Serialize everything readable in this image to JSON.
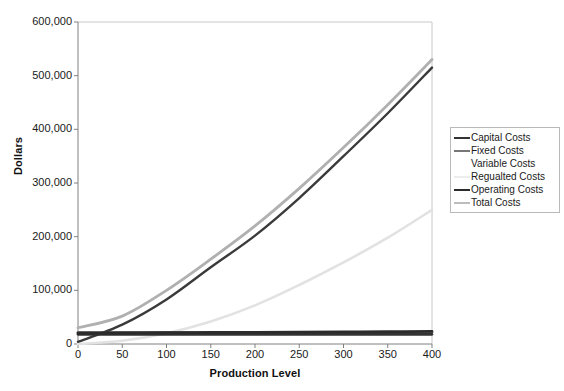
{
  "chart_data": {
    "type": "line",
    "title": "",
    "xlabel": "Production Level",
    "ylabel": "Dollars",
    "xlim": [
      0,
      400
    ],
    "ylim": [
      0,
      600000
    ],
    "x_ticks": [
      "0",
      "50",
      "100",
      "150",
      "200",
      "250",
      "300",
      "350",
      "400"
    ],
    "y_ticks": [
      "0",
      "100,000",
      "200,000",
      "300,000",
      "400,000",
      "500,000",
      "600,000"
    ],
    "x_tick_values": [
      0,
      50,
      100,
      150,
      200,
      250,
      300,
      350,
      400
    ],
    "y_tick_values": [
      0,
      100000,
      200000,
      300000,
      400000,
      500000,
      600000
    ],
    "grid": false,
    "legend_position": "right",
    "x": [
      0,
      50,
      100,
      150,
      200,
      250,
      300,
      350,
      400
    ],
    "series": [
      {
        "name": "Capital Costs",
        "color": "#333333",
        "width": 2.6,
        "values": [
          18000,
          18000,
          18000,
          18000,
          18000,
          18000,
          18000,
          18000,
          18000
        ]
      },
      {
        "name": "Fixed Costs",
        "color": "#777777",
        "width": 2.6,
        "values": [
          22000,
          22000,
          22000,
          22000,
          22000,
          22000,
          22000,
          22000,
          22000
        ]
      },
      {
        "name": "Variable Costs",
        "color": "#3a3a3a",
        "width": 2.4,
        "values": [
          4000,
          36000,
          83000,
          143000,
          202000,
          272000,
          350000,
          430000,
          515000
        ]
      },
      {
        "name": "Regualted Costs",
        "color": "#e2e2e2",
        "width": 2.6,
        "values": [
          0,
          6000,
          20000,
          42000,
          72000,
          110000,
          152000,
          198000,
          250000
        ]
      },
      {
        "name": "Operating Costs",
        "color": "#2b2b2b",
        "width": 2.8,
        "values": [
          20000,
          20500,
          21000,
          21400,
          21800,
          22200,
          22600,
          23000,
          23500
        ]
      },
      {
        "name": "Total Costs",
        "color": "#b0b0b0",
        "width": 2.8,
        "values": [
          30000,
          52000,
          100000,
          158000,
          220000,
          290000,
          366000,
          446000,
          530000
        ]
      }
    ]
  },
  "axes": {
    "y_title": "Dollars",
    "x_title": "Production Level"
  },
  "legend": {
    "items": [
      {
        "label": "Capital Costs",
        "color": "#333333",
        "show_line": true
      },
      {
        "label": "Fixed Costs",
        "color": "#777777",
        "show_line": true
      },
      {
        "label": "Variable Costs",
        "color": "#fdfdfd",
        "show_line": false
      },
      {
        "label": "Regualted Costs",
        "color": "#ededed",
        "show_line": true
      },
      {
        "label": "Operating Costs",
        "color": "#2b2b2b",
        "show_line": true
      },
      {
        "label": "Total Costs",
        "color": "#bdbdbd",
        "show_line": true
      }
    ]
  },
  "style": {
    "axis_color": "#808080",
    "plot_background": "#ffffff"
  }
}
